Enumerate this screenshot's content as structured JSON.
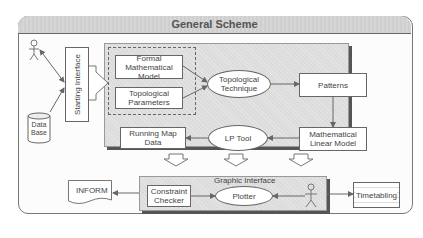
{
  "title": "General Scheme",
  "left": {
    "actor_icon": "actor-icon",
    "database": {
      "icon": "database-icon",
      "label_line1": "Data",
      "label_line2": "Base"
    },
    "starting_interface": "Starting Interface"
  },
  "main_panel": {
    "formal_model": {
      "line1": "Formal",
      "line2": "Mathematical",
      "line3": "Model"
    },
    "topological_parameters": {
      "line1": "Topological",
      "line2": "Parameters"
    },
    "topological_technique": {
      "line1": "Topological",
      "line2": "Technique"
    },
    "patterns": "Patterns",
    "mathematical_linear_model": {
      "line1": "Mathematical",
      "line2": "Linear Model"
    },
    "lp_tool": "LP Tool",
    "running_map_data": {
      "line1": "Running Map",
      "line2": "Data"
    }
  },
  "graphic_interface": {
    "title": "Graphic Interface",
    "constraint_checker": {
      "line1": "Constraint",
      "line2": "Checker"
    },
    "plotter": "Plotter",
    "actor_icon": "actor-icon"
  },
  "outputs": {
    "inform": "INFORM",
    "timetabling": "Timetabling"
  }
}
